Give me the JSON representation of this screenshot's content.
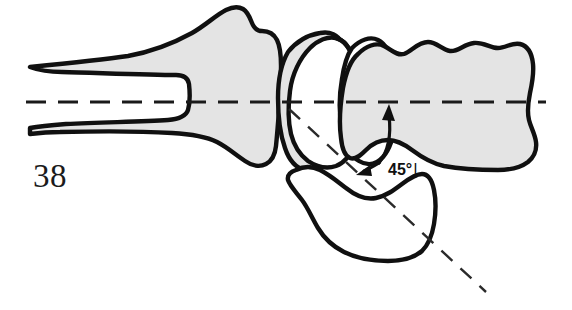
{
  "figure": {
    "number_label": "38",
    "type": "anatomical-line-drawing",
    "caption_text": "",
    "background_color": "#ffffff"
  },
  "annotations": {
    "angle_label": "45°",
    "angle_tick": "|",
    "angle_value": 45,
    "angle_unit": "degrees"
  },
  "colors": {
    "bone_fill": "#e4e4e4",
    "bone_outline": "#101010",
    "fragment_fill": "#ffffff",
    "axis_line": "#1a1a1a",
    "text": "#1b1b1b"
  },
  "structures": [
    {
      "name": "proximal-shaft-bone",
      "fill": "shaded",
      "position": "left",
      "description": "long bone shaft with flared metaphysis"
    },
    {
      "name": "proximal-articular-segment",
      "fill": "shaded",
      "position": "center-left",
      "description": "crescent shaped articular surface"
    },
    {
      "name": "middle-fragment",
      "fill": "white",
      "position": "center",
      "description": "rotated intermediate fragment"
    },
    {
      "name": "distal-bone",
      "fill": "shaded",
      "position": "right",
      "description": "lobed distal bone with wavy superior border"
    },
    {
      "name": "displaced-fragment",
      "fill": "white",
      "position": "center-bottom",
      "description": "displaced inferior fragment angulated 45 degrees"
    }
  ],
  "axes": [
    {
      "name": "longitudinal-axis",
      "style": "dashed",
      "orientation": "horizontal",
      "description": "anatomic long axis through shaft and distal bone"
    },
    {
      "name": "fragment-axis",
      "style": "dashed",
      "orientation": "oblique",
      "description": "axis of displaced fragment, inclined 45 degrees"
    }
  ]
}
